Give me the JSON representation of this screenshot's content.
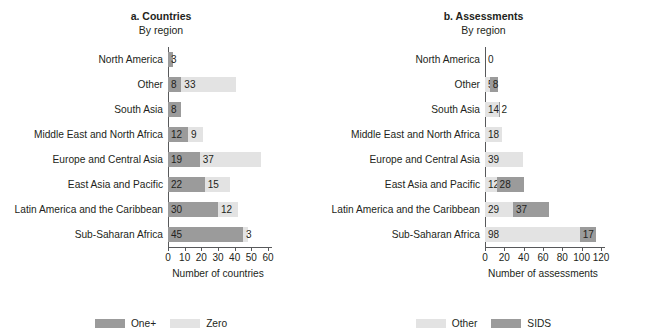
{
  "cropped_header": "",
  "panels": [
    {
      "id": "countries",
      "title": "a. Countries",
      "subtitle": "By region",
      "axis_title": "Number of countries",
      "legend": [
        {
          "label": "One+",
          "tone": "dark"
        },
        {
          "label": "Zero",
          "tone": "light"
        }
      ],
      "chart_data": {
        "type": "bar",
        "orientation": "horizontal",
        "stacked": true,
        "title": "a. Countries",
        "subtitle": "By region",
        "xlabel": "Number of countries",
        "ylabel": "",
        "xlim": [
          0,
          60
        ],
        "xticks": [
          0,
          10,
          20,
          30,
          40,
          50,
          60
        ],
        "grid": false,
        "legend_position": "bottom",
        "categories": [
          "North America",
          "Other",
          "South Asia",
          "Middle East and North Africa",
          "Europe and Central Asia",
          "East Asia and Pacific",
          "Latin America and the Caribbean",
          "Sub-Saharan Africa"
        ],
        "series": [
          {
            "name": "One+",
            "tone": "dark",
            "values": [
              3,
              8,
              8,
              12,
              19,
              22,
              30,
              45
            ]
          },
          {
            "name": "Zero",
            "tone": "light",
            "values": [
              0,
              33,
              0,
              9,
              37,
              15,
              12,
              3
            ]
          }
        ]
      }
    },
    {
      "id": "assessments",
      "title": "b. Assessments",
      "subtitle": "By region",
      "axis_title": "Number of assessments",
      "legend": [
        {
          "label": "Other",
          "tone": "light"
        },
        {
          "label": "SIDS",
          "tone": "dark"
        }
      ],
      "chart_data": {
        "type": "bar",
        "orientation": "horizontal",
        "stacked": true,
        "title": "b. Assessments",
        "subtitle": "By region",
        "xlabel": "Number of assessments",
        "ylabel": "",
        "xlim": [
          0,
          120
        ],
        "xticks": [
          0,
          20,
          40,
          60,
          80,
          100,
          120
        ],
        "grid": false,
        "legend_position": "bottom",
        "categories": [
          "North America",
          "Other",
          "South Asia",
          "Middle East and North Africa",
          "Europe and Central Asia",
          "East Asia and Pacific",
          "Latin America and the Caribbean",
          "Sub-Saharan Africa"
        ],
        "series": [
          {
            "name": "Other",
            "tone": "light",
            "values": [
              0,
              5,
              14,
              18,
              39,
              12,
              29,
              98
            ]
          },
          {
            "name": "SIDS",
            "tone": "dark",
            "values": [
              0,
              8,
              2,
              0,
              0,
              28,
              37,
              17
            ]
          }
        ]
      }
    }
  ],
  "colors": {
    "dark": "#9b9b9b",
    "light": "#e3e3e3",
    "axis": "#58595b",
    "text": "#231f20",
    "background": "#ffffff"
  }
}
